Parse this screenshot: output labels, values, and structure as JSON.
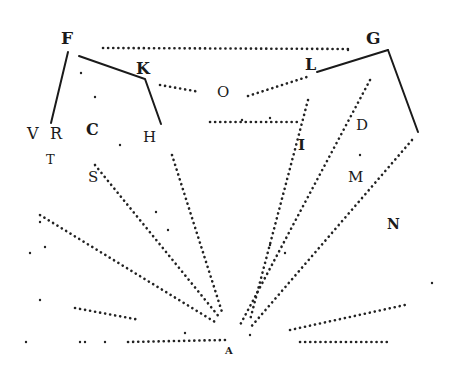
{
  "diagram": {
    "type": "geometric-optics-woodcut",
    "labels": {
      "F": "F",
      "G": "G",
      "K": "K",
      "L": "L",
      "O": "O",
      "V": "V",
      "R": "R",
      "C": "C",
      "H": "H",
      "T": "T",
      "S": "S",
      "D": "D",
      "I": "I",
      "M": "M",
      "N": "N",
      "A": "A"
    },
    "points": {
      "F": [
        67,
        50
      ],
      "K": [
        145,
        78
      ],
      "H": [
        160,
        122
      ],
      "R": [
        52,
        120
      ],
      "G": [
        388,
        50
      ],
      "L": [
        316,
        72
      ],
      "right_end": [
        418,
        132
      ],
      "A": [
        232,
        340
      ]
    },
    "ink_color": "#1a1a1a"
  }
}
